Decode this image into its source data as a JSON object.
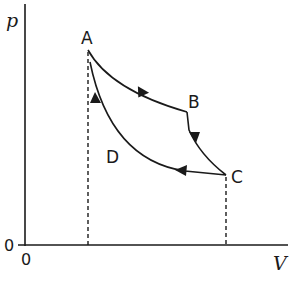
{
  "diagram": {
    "axes": {
      "y_label": "p",
      "x_label": "V",
      "origin_y_label": "0",
      "origin_x_label": "0"
    },
    "points": [
      {
        "id": "A",
        "label": "A"
      },
      {
        "id": "B",
        "label": "B"
      },
      {
        "id": "C",
        "label": "C"
      },
      {
        "id": "D",
        "label": "D"
      }
    ],
    "processes": [
      {
        "from": "A",
        "to": "B",
        "shape": "curve"
      },
      {
        "from": "B",
        "to": "C",
        "shape": "curve"
      },
      {
        "from": "C",
        "to": "A",
        "shape": "curve",
        "via": "D"
      }
    ],
    "dashed_lines": [
      "A-to-V-axis",
      "C-to-V-axis"
    ],
    "colors": {
      "stroke": "#1a1a1a",
      "background": "#ffffff"
    }
  }
}
